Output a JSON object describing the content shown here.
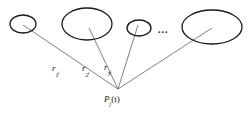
{
  "figure": {
    "background_color": "#ffffff",
    "stroke_color": "#1a1a1a",
    "line_color": "#555555",
    "width": 249,
    "height": 116,
    "nodes": [
      {
        "name": "ellipse-1",
        "cx": 23,
        "cy": 24,
        "rx": 13,
        "ry": 9,
        "rotation": 0
      },
      {
        "name": "ellipse-2",
        "cx": 87,
        "cy": 24,
        "rx": 25,
        "ry": 16,
        "rotation": 0
      },
      {
        "name": "ellipse-3",
        "cx": 139,
        "cy": 28,
        "rx": 12,
        "ry": 8,
        "rotation": 0
      },
      {
        "name": "ellipse-4",
        "cx": 212,
        "cy": 27,
        "rx": 30,
        "ry": 17,
        "rotation": 0
      }
    ],
    "origin": {
      "name": "source-point",
      "x": 118,
      "y": 89
    },
    "connectors": [
      {
        "name": "connector-r1",
        "x1": 23,
        "y1": 25,
        "x2": 118,
        "y2": 89
      },
      {
        "name": "connector-r2",
        "x1": 89,
        "y1": 28,
        "x2": 118,
        "y2": 89
      },
      {
        "name": "connector-r3",
        "x1": 138,
        "y1": 25,
        "x2": 118,
        "y2": 89
      },
      {
        "name": "connector-r4",
        "x1": 212,
        "y1": 28,
        "x2": 118,
        "y2": 89
      }
    ],
    "labels": {
      "r1": {
        "base": "r",
        "sub": "1",
        "sub2": "j"
      },
      "r2": {
        "base": "r",
        "sub": "2",
        "sub2": "j"
      },
      "r3": {
        "base": "r",
        "sub": "3",
        "sub2": "j"
      },
      "ellipsis": "...",
      "point": {
        "base": "P",
        "sub": "j",
        "suffix": "(t)"
      }
    }
  }
}
